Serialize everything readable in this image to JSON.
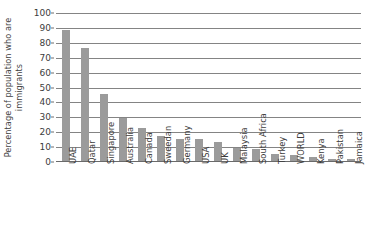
{
  "chart_data": {
    "type": "bar",
    "title": "",
    "xlabel": "",
    "ylabel": "Percentage of population who are immigrants",
    "ylabel_line1": "Percentage of population who are",
    "ylabel_line2": "immigrants",
    "ylim": [
      0,
      100
    ],
    "ytick_labels": [
      "0",
      "10",
      "20",
      "30",
      "40",
      "50",
      "60",
      "70",
      "80",
      "90",
      "100"
    ],
    "ytick_values": [
      0,
      10,
      20,
      30,
      40,
      50,
      60,
      70,
      80,
      90,
      100
    ],
    "grid": true,
    "legend": false,
    "bar_color": "#9b9b9b",
    "gridline_color": "#848484",
    "categories": [
      "UAE",
      "Qatar",
      "Singapore",
      "Australia",
      "Canada",
      "Sweedan",
      "Germany",
      "USA",
      "UK",
      "Malaysia",
      "South Africa",
      "Turkey",
      "WORLD",
      "Kenya",
      "Pakistan",
      "Jamaica"
    ],
    "values": [
      88,
      76,
      45,
      29,
      22,
      17,
      15,
      15,
      13,
      9,
      8,
      5,
      4,
      3,
      1.5,
      1.5
    ]
  }
}
